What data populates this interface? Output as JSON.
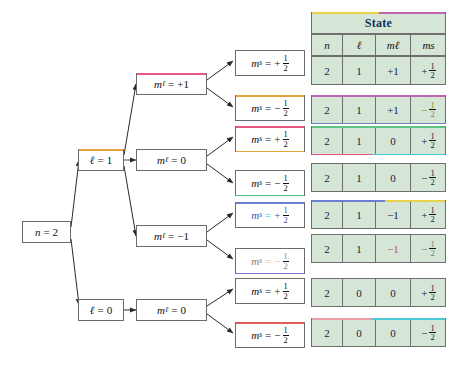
{
  "figure": {
    "root_label": "n = 2"
  },
  "tree": {
    "root": {
      "name": "n",
      "op": "=",
      "value": "2"
    },
    "level_l": [
      {
        "name": "ℓ",
        "op": "=",
        "value": "1"
      },
      {
        "name": "ℓ",
        "op": "=",
        "value": "0"
      }
    ],
    "level_ml": [
      {
        "name": "m",
        "sub": "ℓ",
        "op": "=",
        "value": "+1"
      },
      {
        "name": "m",
        "sub": "ℓ",
        "op": "=",
        "value": "0"
      },
      {
        "name": "m",
        "sub": "ℓ",
        "op": "=",
        "value": "−1"
      },
      {
        "name": "m",
        "sub": "ℓ",
        "op": "=",
        "value": "0"
      }
    ],
    "level_ms": [
      {
        "name": "m",
        "sub": "s",
        "op": "=",
        "sign": "+",
        "num": "1",
        "den": "2"
      },
      {
        "name": "m",
        "sub": "s",
        "op": "=",
        "sign": "−",
        "num": "1",
        "den": "2"
      },
      {
        "name": "m",
        "sub": "s",
        "op": "=",
        "sign": "+",
        "num": "1",
        "den": "2"
      },
      {
        "name": "m",
        "sub": "s",
        "op": "=",
        "sign": "−",
        "num": "1",
        "den": "2"
      },
      {
        "name": "m",
        "sub": "s",
        "op": "=",
        "sign": "+",
        "num": "1",
        "den": "2"
      },
      {
        "name": "m",
        "sub": "s",
        "op": "=",
        "sign": "−",
        "num": "1",
        "den": "2"
      },
      {
        "name": "m",
        "sub": "s",
        "op": "=",
        "sign": "+",
        "num": "1",
        "den": "2"
      },
      {
        "name": "m",
        "sub": "s",
        "op": "=",
        "sign": "−",
        "num": "1",
        "den": "2"
      }
    ]
  },
  "table": {
    "title": "State",
    "headers": [
      {
        "name": "n"
      },
      {
        "name": "ℓ"
      },
      {
        "name": "m",
        "sub": "ℓ"
      },
      {
        "name": "m",
        "sub": "s"
      }
    ],
    "rows": [
      {
        "n": "2",
        "l": "1",
        "ml": "+1",
        "ms_sign": "+",
        "ms_num": "1",
        "ms_den": "2"
      },
      {
        "n": "2",
        "l": "1",
        "ml": "+1",
        "ms_sign": "−",
        "ms_num": "1",
        "ms_den": "2"
      },
      {
        "n": "2",
        "l": "1",
        "ml": "0",
        "ms_sign": "+",
        "ms_num": "1",
        "ms_den": "2"
      },
      {
        "n": "2",
        "l": "1",
        "ml": "0",
        "ms_sign": "−",
        "ms_num": "1",
        "ms_den": "2"
      },
      {
        "n": "2",
        "l": "1",
        "ml": "−1",
        "ms_sign": "+",
        "ms_num": "1",
        "ms_den": "2"
      },
      {
        "n": "2",
        "l": "1",
        "ml": "−1",
        "ms_sign": "−",
        "ms_num": "1",
        "ms_den": "2"
      },
      {
        "n": "2",
        "l": "0",
        "ml": "0",
        "ms_sign": "+",
        "ms_num": "1",
        "ms_den": "2"
      },
      {
        "n": "2",
        "l": "0",
        "ml": "0",
        "ms_sign": "−",
        "ms_num": "1",
        "ms_den": "2"
      }
    ]
  },
  "colors": {
    "table_fill": "#d6e6d6",
    "table_border": "#6f6f6f",
    "state_text": "#16305a",
    "node_border": "#6b6b6b",
    "wire": "#2a2a2a",
    "artifact_yellow": "#e8d24a",
    "artifact_magenta": "#c264b4",
    "artifact_orange": "#e8a33d",
    "artifact_pink": "#e8577f",
    "artifact_blue": "#6a7fd0",
    "artifact_cyan": "#49c9d8",
    "artifact_green": "#5fc48a",
    "artifact_purple": "#8e6fd0",
    "artifact_red": "#e05a5a"
  }
}
